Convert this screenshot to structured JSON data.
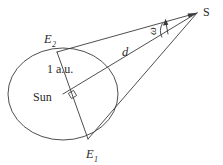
{
  "figure": {
    "background_color": "#ffffff",
    "stroke_color": "#3a3a3a",
    "text_color": "#2b2b2b"
  },
  "labels": {
    "star": "S",
    "earth_position_2_base": "E",
    "earth_position_2_sub": "2",
    "earth_position_1_base": "E",
    "earth_position_1_sub": "1",
    "sun": "Sun",
    "baseline_distance": "1 a.u.",
    "star_distance": "d",
    "parallax_angle": "ω"
  },
  "geometry": {
    "orbit_ellipse": {
      "center_x": 63,
      "center_y": 94,
      "radius_x": 55,
      "radius_y": 46
    },
    "sun_point": {
      "x": 63,
      "y": 94
    },
    "star_point": {
      "x": 197,
      "y": 13
    },
    "earth_2_point": {
      "x": 57,
      "y": 52
    },
    "earth_1_point": {
      "x": 88,
      "y": 139
    },
    "right_angle_marker": {
      "x": 73,
      "y": 97
    },
    "angle_arc_center": {
      "x": 197,
      "y": 13
    },
    "angle_arc_radius": 38
  },
  "elements": {
    "line_e2_to_star": "E2-S sight line",
    "line_e1_to_star": "E1-S sight line",
    "line_sun_to_star": "Sun-S distance line d",
    "line_e2_to_e1": "E2-E1 baseline through Sun",
    "orbit": "Earth orbit ellipse",
    "angle_indicator": "parallax angle omega with arrow"
  }
}
